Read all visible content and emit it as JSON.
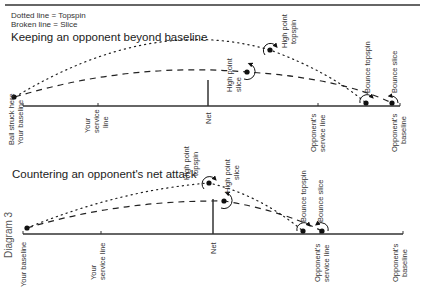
{
  "legend": {
    "dotted": "Dotted line = Topspin",
    "broken": "Broken line = Slice"
  },
  "side_label": "Diagram 3",
  "diagram1": {
    "title": "Keeping an opponent beyond baseline",
    "court_labels": {
      "ball_struck": "Ball struck here",
      "your_baseline": "Your baseline",
      "your_service_1": "Your",
      "your_service_2": "service",
      "your_service_3": "line",
      "net": "Net",
      "opp_service_1": "Opponent's",
      "opp_service_2": "service line",
      "opp_baseline_1": "Opponent's",
      "opp_baseline_2": "baseline"
    },
    "ball_labels": {
      "high_topspin_1": "High point",
      "high_topspin_2": "topspin",
      "high_slice_1": "High point",
      "high_slice_2": "slice",
      "bounce_topspin": "Bounce topspin",
      "bounce_slice": "Bounce slice"
    }
  },
  "diagram2": {
    "title": "Countering an opponent's net attack",
    "court_labels": {
      "your_baseline": "Your baseline",
      "your_service_1": "Your",
      "your_service_2": "service line",
      "net": "Net",
      "opp_service_1": "Opponent's",
      "opp_service_2": "service line",
      "opp_baseline_1": "Opponent's",
      "opp_baseline_2": "baseline"
    },
    "ball_labels": {
      "high_topspin_1": "High point",
      "high_topspin_2": "topspin",
      "high_slice_1": "High point",
      "high_slice_2": "slice",
      "bounce_topspin": "Bounce topspin",
      "bounce_slice": "Bounce slice"
    }
  }
}
